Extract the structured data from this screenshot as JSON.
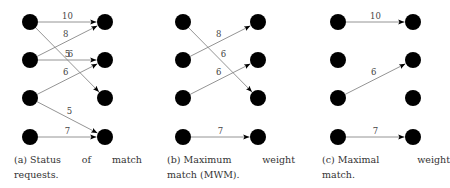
{
  "figure": {
    "node_rows_y": [
      22,
      60,
      98,
      137
    ],
    "node_radius": 8,
    "edge_color": "#888888",
    "node_color": "#000000",
    "panels": [
      {
        "id": "a",
        "left_x": 30,
        "right_x": 105,
        "offset_x": 0,
        "caption_tag": "(a)",
        "caption_text": "Status of match requests.",
        "edges": [
          {
            "from": 0,
            "to": 0,
            "weight": "10"
          },
          {
            "from": 1,
            "to": 0,
            "weight": "8"
          },
          {
            "from": 0,
            "to": 2,
            "weight": "6"
          },
          {
            "from": 1,
            "to": 1,
            "weight": "5"
          },
          {
            "from": 2,
            "to": 1,
            "weight": "6"
          },
          {
            "from": 2,
            "to": 3,
            "weight": "5"
          },
          {
            "from": 3,
            "to": 3,
            "weight": "7"
          }
        ]
      },
      {
        "id": "b",
        "left_x": 183,
        "right_x": 258,
        "offset_x": 0,
        "caption_tag": "(b)",
        "caption_text": "Maximum weight match (MWM).",
        "edges": [
          {
            "from": 1,
            "to": 0,
            "weight": "8"
          },
          {
            "from": 0,
            "to": 2,
            "weight": "6"
          },
          {
            "from": 2,
            "to": 1,
            "weight": "6"
          },
          {
            "from": 3,
            "to": 3,
            "weight": "7"
          }
        ]
      },
      {
        "id": "c",
        "left_x": 338,
        "right_x": 413,
        "offset_x": 0,
        "caption_tag": "(c)",
        "caption_text": "Maximal weight match.",
        "edges": [
          {
            "from": 0,
            "to": 0,
            "weight": "10"
          },
          {
            "from": 2,
            "to": 1,
            "weight": "6"
          },
          {
            "from": 3,
            "to": 3,
            "weight": "7"
          }
        ]
      }
    ]
  }
}
